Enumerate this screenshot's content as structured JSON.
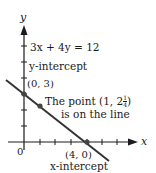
{
  "diagram": {
    "equation": "3x + 4y = 12",
    "axes": {
      "x_label": "x",
      "y_label": "y",
      "origin_label": "0"
    },
    "y_intercept": {
      "label": "y-intercept",
      "point": "(0, 3)"
    },
    "x_intercept": {
      "label": "x-intercept",
      "point": "(4, 0)"
    },
    "point_note": {
      "line1_prefix": "The point (1, 2",
      "frac_num": "1",
      "frac_den": "4",
      "line1_suffix": ")",
      "line2": "is on the line"
    },
    "colors": {
      "ink": "#1a1a1a",
      "line": "#333333",
      "point": "#444444"
    }
  }
}
